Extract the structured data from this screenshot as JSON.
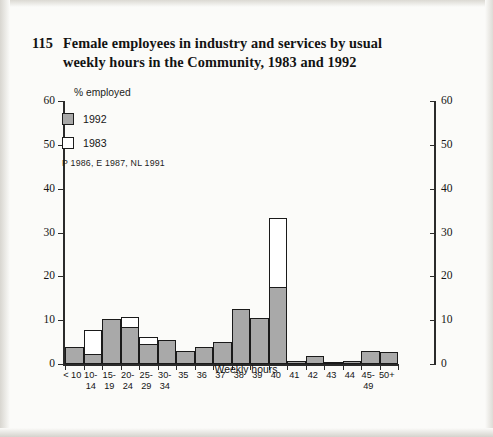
{
  "title": {
    "number": "115",
    "line1": "Female employees in industry and services by usual",
    "line2": "weekly hours in the Community, 1983 and 1992"
  },
  "legend": {
    "items": [
      {
        "label": "1992",
        "style": "filled",
        "color": "#a9a9a9"
      },
      {
        "label": "1983",
        "style": "open",
        "color": "#ffffff"
      }
    ],
    "note": "P 1986, E 1987, NL 1991"
  },
  "axes": {
    "y_caption": "% employed",
    "x_title": "Weekly hours",
    "y_ticks": [
      "0",
      "10",
      "20",
      "30",
      "40",
      "50",
      "60"
    ],
    "y_ticks_right": [
      "0",
      "10",
      "20",
      "30",
      "40",
      "50",
      "60"
    ]
  },
  "chart_data": {
    "type": "bar",
    "title": "Female employees in industry and services by usual weekly hours in the Community, 1983 and 1992",
    "xlabel": "Weekly hours",
    "ylabel": "% employed",
    "ylim": [
      0,
      60
    ],
    "grid": false,
    "legend_position": "top-left",
    "categories": [
      "< 10",
      "10-14",
      "15-19",
      "20-24",
      "25-29",
      "30-34",
      "35",
      "36",
      "37",
      "38",
      "39",
      "40",
      "41",
      "42",
      "43",
      "44",
      "45-49",
      "50+"
    ],
    "category_labels": [
      {
        "top": "< 10",
        "bottom": ""
      },
      {
        "top": "10-",
        "bottom": "14"
      },
      {
        "top": "15-",
        "bottom": "19"
      },
      {
        "top": "20-",
        "bottom": "24"
      },
      {
        "top": "25-",
        "bottom": "29"
      },
      {
        "top": "30-",
        "bottom": "34"
      },
      {
        "top": "35",
        "bottom": ""
      },
      {
        "top": "36",
        "bottom": ""
      },
      {
        "top": "37",
        "bottom": ""
      },
      {
        "top": "38",
        "bottom": ""
      },
      {
        "top": "39",
        "bottom": ""
      },
      {
        "top": "40",
        "bottom": ""
      },
      {
        "top": "41",
        "bottom": ""
      },
      {
        "top": "42",
        "bottom": ""
      },
      {
        "top": "43",
        "bottom": ""
      },
      {
        "top": "44",
        "bottom": ""
      },
      {
        "top": "45-",
        "bottom": "49"
      },
      {
        "top": "50+",
        "bottom": ""
      }
    ],
    "series": [
      {
        "name": "1983",
        "color": "#ffffff",
        "values": [
          3.5,
          7.8,
          8.0,
          10.8,
          6.2,
          5.2,
          3.0,
          3.8,
          4.0,
          12.5,
          10.0,
          33.3,
          0.7,
          1.8,
          0.5,
          0.8,
          3.0,
          2.8
        ]
      },
      {
        "name": "1992",
        "color": "#a9a9a9",
        "values": [
          3.8,
          2.2,
          10.2,
          8.5,
          4.5,
          5.5,
          3.0,
          3.8,
          5.0,
          12.5,
          10.5,
          17.5,
          0.7,
          1.8,
          0.5,
          0.8,
          3.0,
          2.8
        ]
      }
    ]
  }
}
